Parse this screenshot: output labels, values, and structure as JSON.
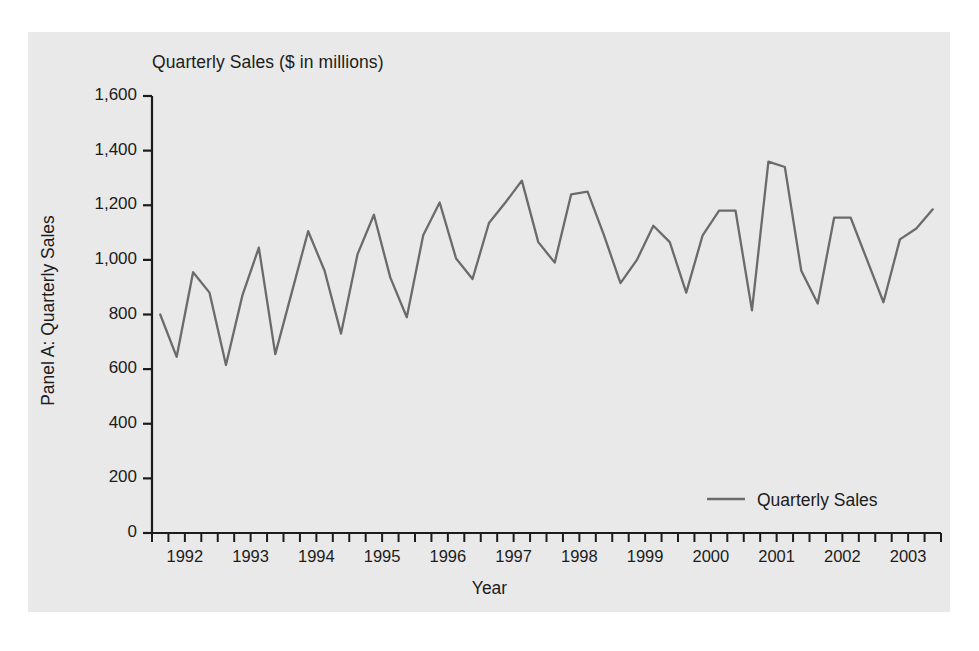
{
  "figure": {
    "background_color": "#ffffff",
    "panel_color": "#e9e9e9",
    "line_color": "#6b6b6b",
    "axis_color": "#1c1c1c",
    "title": "Quarterly Sales ($ in millions)"
  },
  "chart_data": {
    "type": "line",
    "title": "Quarterly Sales ($ in millions)",
    "xlabel": "Year",
    "ylabel": "Panel A: Quarterly Sales",
    "ylim": [
      0,
      1600
    ],
    "yticks": [
      0,
      200,
      400,
      600,
      800,
      1000,
      1200,
      1400,
      1600
    ],
    "ytick_labels": [
      "0",
      "200",
      "400",
      "600",
      "800",
      "1,000",
      "1,200",
      "1,400",
      "1,600"
    ],
    "xtick_labels": [
      "1992",
      "1993",
      "1994",
      "1995",
      "1996",
      "1997",
      "1998",
      "1999",
      "2000",
      "2001",
      "2002",
      "2003"
    ],
    "minor_ticks_per_year": 4,
    "grid": false,
    "legend_position": "bottom-right",
    "legend": [
      "Quarterly Sales"
    ],
    "x": [
      "1992 Q1",
      "1992 Q2",
      "1992 Q3",
      "1992 Q4",
      "1993 Q1",
      "1993 Q2",
      "1993 Q3",
      "1993 Q4",
      "1994 Q1",
      "1994 Q2",
      "1994 Q3",
      "1994 Q4",
      "1995 Q1",
      "1995 Q2",
      "1995 Q3",
      "1995 Q4",
      "1996 Q1",
      "1996 Q2",
      "1996 Q3",
      "1996 Q4",
      "1997 Q1",
      "1997 Q2",
      "1997 Q3",
      "1997 Q4",
      "1998 Q1",
      "1998 Q2",
      "1998 Q3",
      "1998 Q4",
      "1999 Q1",
      "1999 Q2",
      "1999 Q3",
      "1999 Q4",
      "2000 Q1",
      "2000 Q2",
      "2000 Q3",
      "2000 Q4",
      "2001 Q1",
      "2001 Q2",
      "2001 Q3",
      "2001 Q4",
      "2002 Q1",
      "2002 Q2",
      "2002 Q3",
      "2002 Q4",
      "2003 Q1",
      "2003 Q2",
      "2003 Q3",
      "2003 Q4"
    ],
    "series": [
      {
        "name": "Quarterly Sales",
        "color": "#6b6b6b",
        "values": [
          800,
          645,
          955,
          880,
          615,
          870,
          1045,
          655,
          880,
          1105,
          960,
          730,
          1020,
          1165,
          935,
          790,
          1090,
          1210,
          1005,
          930,
          1135,
          1210,
          1290,
          1065,
          990,
          1240,
          1250,
          1090,
          915,
          1000,
          1125,
          1065,
          880,
          1090,
          1180,
          1180,
          815,
          1360,
          1340,
          960,
          840,
          1155,
          1155,
          1000,
          845,
          1075,
          1115,
          1185
        ]
      }
    ]
  },
  "legend": {
    "swatch_color": "#6b6b6b",
    "label": "Quarterly Sales"
  },
  "axes": {
    "x_axis_label": "Year",
    "y_axis_label": "Panel A: Quarterly Sales"
  }
}
